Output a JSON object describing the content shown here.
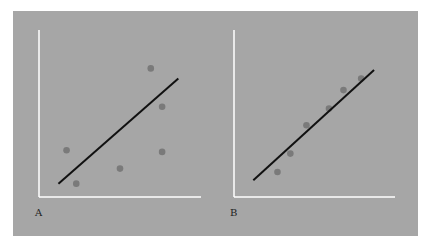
{
  "chart_data": [
    {
      "type": "scatter",
      "panel_label": "A",
      "title": "",
      "xlabel": "",
      "ylabel": "",
      "xlim": [
        0,
        10
      ],
      "ylim": [
        0,
        10
      ],
      "grid": false,
      "points": [
        {
          "x": 1.7,
          "y": 2.8
        },
        {
          "x": 2.3,
          "y": 0.8
        },
        {
          "x": 5.0,
          "y": 1.7
        },
        {
          "x": 6.9,
          "y": 7.7
        },
        {
          "x": 7.6,
          "y": 5.4
        },
        {
          "x": 7.6,
          "y": 2.7
        }
      ],
      "fit_line": {
        "x0": 1.2,
        "y0": 0.8,
        "x1": 8.6,
        "y1": 7.1
      }
    },
    {
      "type": "scatter",
      "panel_label": "B",
      "title": "",
      "xlabel": "",
      "ylabel": "",
      "xlim": [
        0,
        10
      ],
      "ylim": [
        0,
        10
      ],
      "grid": false,
      "points": [
        {
          "x": 2.7,
          "y": 1.5
        },
        {
          "x": 3.5,
          "y": 2.6
        },
        {
          "x": 4.5,
          "y": 4.3
        },
        {
          "x": 5.9,
          "y": 5.3
        },
        {
          "x": 6.8,
          "y": 6.4
        },
        {
          "x": 7.9,
          "y": 7.1
        }
      ],
      "fit_line": {
        "x0": 1.2,
        "y0": 1.0,
        "x1": 8.7,
        "y1": 7.6
      }
    }
  ],
  "colors": {
    "background": "#a6a6a6",
    "axes": "#ffffff",
    "points": "#7a7a7a",
    "line": "#111111"
  }
}
